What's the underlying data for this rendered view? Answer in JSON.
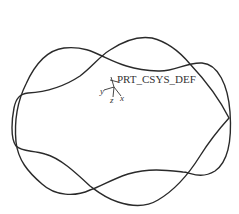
{
  "view": {
    "background": "#ffffff",
    "stroke_color": "#2a2a2a"
  },
  "csys": {
    "name": "PRT_CSYS_DEF",
    "axis_x": "x",
    "axis_y": "y",
    "axis_z": "z"
  },
  "curves": [
    {
      "name": "spline-curve-1"
    },
    {
      "name": "spline-curve-2"
    }
  ]
}
